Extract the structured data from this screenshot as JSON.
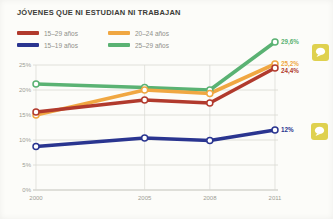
{
  "title": "JÓVENES QUE NI ESTUDIAN NI TRABAJAN",
  "legend": {
    "items": [
      {
        "label": "15–29 años",
        "color": "#b13a2d"
      },
      {
        "label": "15–19 años",
        "color": "#2a3590"
      },
      {
        "label": "20–24 años",
        "color": "#f0a742"
      },
      {
        "label": "25–29 años",
        "color": "#5ab273"
      }
    ]
  },
  "annotations": {
    "comment_button_color": "#dfd14f",
    "comment_icon": "speech-bubble"
  },
  "chart_data": {
    "type": "line",
    "x": [
      2000,
      2005,
      2008,
      2011
    ],
    "x_tick_labels": [
      "2000",
      "2005",
      "2008",
      "2011"
    ],
    "y_ticks": [
      0,
      5,
      10,
      15,
      20,
      25
    ],
    "y_tick_labels": [
      "0%",
      "5%",
      "10%",
      "15%",
      "20%",
      "25%"
    ],
    "ylim": [
      0,
      31
    ],
    "xlabel": "",
    "ylabel": "",
    "grid": true,
    "legend_position": "top-left",
    "series": [
      {
        "name": "25–29 años",
        "color": "#5ab273",
        "values": [
          21.2,
          20.5,
          20.0,
          29.6
        ],
        "end_label": "29,6%"
      },
      {
        "name": "20–24 años",
        "color": "#f0a742",
        "values": [
          15.0,
          20.0,
          19.3,
          25.2
        ],
        "end_label": "25,2%"
      },
      {
        "name": "15–29 años",
        "color": "#b13a2d",
        "values": [
          15.6,
          18.0,
          17.4,
          24.4
        ],
        "end_label": "24,4%"
      },
      {
        "name": "15–19 años",
        "color": "#2a3590",
        "values": [
          8.7,
          10.4,
          9.9,
          12.0
        ],
        "end_label": "12%"
      }
    ],
    "colors": {
      "grid": "#d9d9d3",
      "axis": "#c2c2ba",
      "tick_text": "#9c9c95"
    }
  }
}
